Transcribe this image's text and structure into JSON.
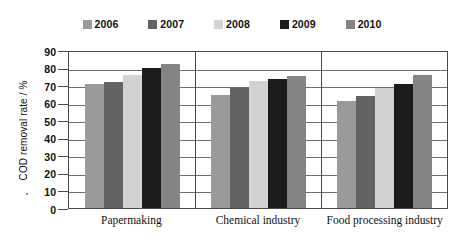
{
  "chart_data": {
    "type": "bar",
    "title": "",
    "xlabel": "",
    "ylabel": "COD removal rate / %",
    "ylim": [
      0,
      90
    ],
    "ytick_step": 10,
    "yticks": [
      90,
      80,
      70,
      60,
      50,
      40,
      30,
      20,
      10,
      0
    ],
    "grid": true,
    "legend_position": "top-center",
    "categories": [
      "Papermaking",
      "Chemical industry",
      "Food processing industry"
    ],
    "series": [
      {
        "name": "2006",
        "color": "#9a9a9a",
        "values": [
          70.5,
          64.5,
          61.0
        ]
      },
      {
        "name": "2007",
        "color": "#636363",
        "values": [
          72.0,
          68.5,
          64.0
        ]
      },
      {
        "name": "2008",
        "color": "#d2d2d2",
        "values": [
          76.0,
          72.5,
          68.5
        ]
      },
      {
        "name": "2009",
        "color": "#1c1c1c",
        "values": [
          80.0,
          73.5,
          70.5
        ]
      },
      {
        "name": "2010",
        "color": "#848484",
        "values": [
          82.0,
          75.0,
          75.5
        ]
      }
    ]
  },
  "colors": {
    "axis": "#4a4a4a",
    "gridline": "#6e6e6e",
    "text": "#111111",
    "background": "#ffffff"
  }
}
